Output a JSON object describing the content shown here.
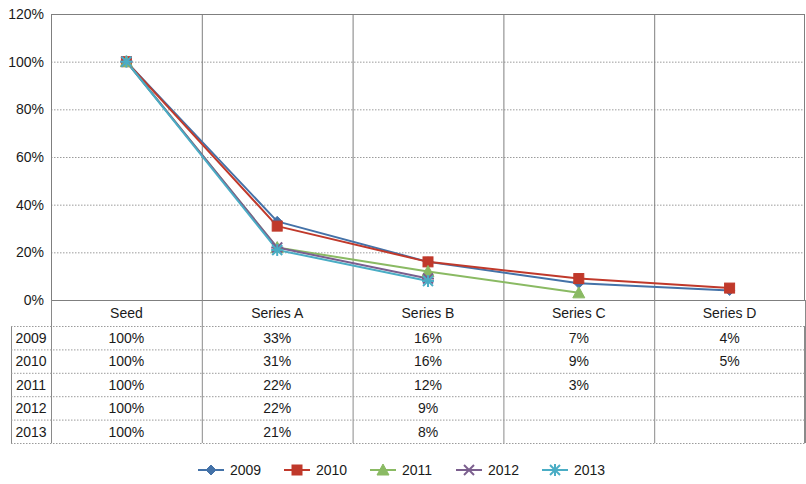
{
  "chart_data": {
    "type": "line",
    "title": "",
    "xlabel": "",
    "ylabel": "",
    "categories": [
      "Seed",
      "Series A",
      "Series B",
      "Series C",
      "Series D"
    ],
    "ylim": [
      0,
      120
    ],
    "y_ticks": [
      "0%",
      "20%",
      "40%",
      "60%",
      "80%",
      "100%",
      "120%"
    ],
    "y_tick_values": [
      0,
      20,
      40,
      60,
      80,
      100,
      120
    ],
    "grid": true,
    "legend_position": "bottom",
    "series": [
      {
        "name": "2009",
        "color": "#4472a8",
        "marker": "diamond",
        "values": [
          100,
          33,
          16,
          7,
          4
        ]
      },
      {
        "name": "2010",
        "color": "#c0392b",
        "marker": "square",
        "values": [
          100,
          31,
          16,
          9,
          5
        ]
      },
      {
        "name": "2011",
        "color": "#8aba63",
        "marker": "triangle",
        "values": [
          100,
          22,
          12,
          3,
          null
        ]
      },
      {
        "name": "2012",
        "color": "#7b5f8e",
        "marker": "x",
        "values": [
          100,
          22,
          9,
          null,
          null
        ]
      },
      {
        "name": "2013",
        "color": "#4aadc5",
        "marker": "asterisk",
        "values": [
          100,
          21,
          8,
          null,
          null
        ]
      }
    ]
  },
  "data_table": {
    "column_headers": [
      "Seed",
      "Series A",
      "Series B",
      "Series C",
      "Series D"
    ],
    "row_headers": [
      "2009",
      "2010",
      "2011",
      "2012",
      "2013"
    ],
    "rows": [
      [
        "100%",
        "33%",
        "16%",
        "7%",
        "4%"
      ],
      [
        "100%",
        "31%",
        "16%",
        "9%",
        "5%"
      ],
      [
        "100%",
        "22%",
        "12%",
        "3%",
        ""
      ],
      [
        "100%",
        "22%",
        "9%",
        "",
        ""
      ],
      [
        "100%",
        "21%",
        "8%",
        "",
        ""
      ]
    ]
  },
  "legend": {
    "items": [
      {
        "label": "2009",
        "color": "#4472a8",
        "marker": "diamond"
      },
      {
        "label": "2010",
        "color": "#c0392b",
        "marker": "square"
      },
      {
        "label": "2011",
        "color": "#8aba63",
        "marker": "triangle"
      },
      {
        "label": "2012",
        "color": "#7b5f8e",
        "marker": "x"
      },
      {
        "label": "2013",
        "color": "#4aadc5",
        "marker": "asterisk"
      }
    ]
  }
}
